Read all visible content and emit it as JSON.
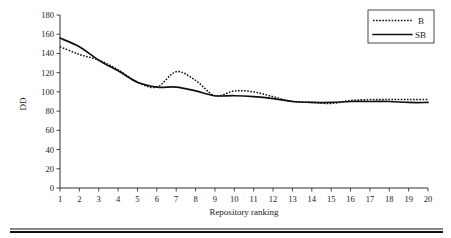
{
  "chart_data": {
    "type": "line",
    "title": "",
    "xlabel": "Repository ranking",
    "ylabel": "DD",
    "xlim": [
      1,
      20
    ],
    "ylim": [
      0,
      180
    ],
    "grid": false,
    "legend_position": "top-right",
    "x": [
      1,
      2,
      3,
      4,
      5,
      6,
      7,
      8,
      9,
      10,
      11,
      12,
      13,
      14,
      15,
      16,
      17,
      18,
      19,
      20
    ],
    "xtick_labels": [
      "1",
      "2",
      "3",
      "4",
      "5",
      "6",
      "7",
      "8",
      "9",
      "10",
      "11",
      "12",
      "13",
      "14",
      "15",
      "16",
      "17",
      "18",
      "19",
      "20"
    ],
    "ytick_labels": [
      "0",
      "20",
      "40",
      "60",
      "80",
      "100",
      "120",
      "140",
      "160",
      "180"
    ],
    "ytick_values": [
      0,
      20,
      40,
      60,
      80,
      100,
      120,
      140,
      160,
      180
    ],
    "series": [
      {
        "name": "B",
        "style": "dotted",
        "color": "#101010",
        "values": [
          147,
          139,
          133,
          123,
          110,
          105,
          121,
          112,
          96,
          101,
          100,
          95,
          90,
          89,
          88,
          91,
          92,
          92,
          92,
          92
        ]
      },
      {
        "name": "SB",
        "style": "solid",
        "color": "#101010",
        "values": [
          156,
          147,
          133,
          122,
          110,
          105,
          105,
          101,
          96,
          96,
          95,
          93,
          90,
          89,
          89,
          90,
          90,
          90,
          89,
          89
        ]
      }
    ]
  },
  "legend": {
    "entries": [
      {
        "label": "B",
        "style": "dotted"
      },
      {
        "label": "SB",
        "style": "solid"
      }
    ]
  },
  "axes": {
    "y_axis_title": "DD",
    "x_axis_title": "Repository ranking"
  }
}
